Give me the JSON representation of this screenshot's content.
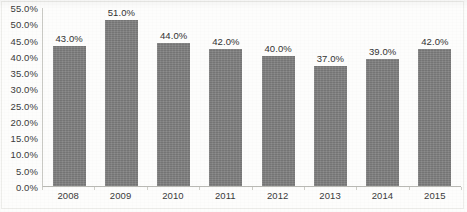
{
  "chart_data": {
    "type": "bar",
    "title": "",
    "xlabel": "",
    "ylabel": "",
    "categories": [
      "2008",
      "2009",
      "2010",
      "2011",
      "2012",
      "2013",
      "2014",
      "2015"
    ],
    "values": [
      43.0,
      51.0,
      44.0,
      42.0,
      40.0,
      37.0,
      39.0,
      42.0
    ],
    "data_labels": [
      "43.0%",
      "51.0%",
      "44.0%",
      "42.0%",
      "40.0%",
      "37.0%",
      "39.0%",
      "42.0%"
    ],
    "ylim": [
      0,
      55
    ],
    "ytick_values": [
      0,
      5,
      10,
      15,
      20,
      25,
      30,
      35,
      40,
      45,
      50,
      55
    ],
    "ytick_labels": [
      "0.0%",
      "5.0%",
      "10.0%",
      "15.0%",
      "20.0%",
      "25.0%",
      "30.0%",
      "35.0%",
      "40.0%",
      "45.0%",
      "50.0%",
      "55.0%"
    ],
    "grid": false,
    "legend": null,
    "legend_position": "none",
    "series": [
      {
        "name": "",
        "values": [
          43.0,
          51.0,
          44.0,
          42.0,
          40.0,
          37.0,
          39.0,
          42.0
        ],
        "color": "#808080"
      }
    ],
    "colors": {
      "bar": "#808080",
      "axis": "#b9b9b4",
      "text": "#333333",
      "background": "#fdfdfc"
    }
  }
}
